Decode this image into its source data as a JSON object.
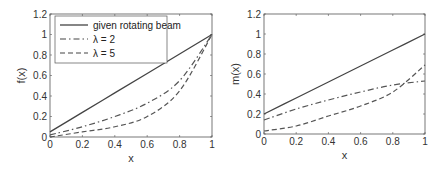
{
  "chart_data": [
    {
      "type": "line",
      "title": "",
      "xlabel": "x",
      "ylabel": "f(x)",
      "xlim": [
        0,
        1
      ],
      "ylim": [
        0,
        1.2
      ],
      "xticks": [
        "0",
        "0.2",
        "0.4",
        "0.6",
        "0.8",
        "1"
      ],
      "yticks": [
        "0",
        "0.2",
        "0.4",
        "0.6",
        "0.8",
        "1",
        "1.2"
      ],
      "grid": false,
      "legend_position": "upper left",
      "x": [
        0,
        0.2,
        0.4,
        0.6,
        0.8,
        1.0
      ],
      "series": [
        {
          "name": "given rotating beam",
          "style": "solid",
          "values": [
            0.05,
            0.24,
            0.43,
            0.62,
            0.81,
            1.0
          ]
        },
        {
          "name": "λ = 2",
          "style": "dash-dot",
          "values": [
            0.02,
            0.1,
            0.2,
            0.33,
            0.55,
            1.0
          ]
        },
        {
          "name": "λ = 5",
          "style": "dashed",
          "values": [
            0.0,
            0.05,
            0.1,
            0.2,
            0.45,
            1.0
          ]
        }
      ]
    },
    {
      "type": "line",
      "title": "",
      "xlabel": "x",
      "ylabel": "m(x)",
      "xlim": [
        0,
        1
      ],
      "ylim": [
        0,
        1.2
      ],
      "xticks": [
        "0",
        "0.2",
        "0.4",
        "0.6",
        "0.8",
        "1"
      ],
      "yticks": [
        "0",
        "0.2",
        "0.4",
        "0.6",
        "0.8",
        "1",
        "1.2"
      ],
      "grid": false,
      "x": [
        0,
        0.2,
        0.4,
        0.6,
        0.8,
        1.0
      ],
      "series": [
        {
          "name": "given rotating beam",
          "style": "solid",
          "values": [
            0.2,
            0.36,
            0.52,
            0.68,
            0.84,
            1.0
          ]
        },
        {
          "name": "λ = 2",
          "style": "dash-dot",
          "values": [
            0.14,
            0.25,
            0.34,
            0.42,
            0.49,
            0.53
          ]
        },
        {
          "name": "λ = 5",
          "style": "dashed",
          "values": [
            0.03,
            0.08,
            0.18,
            0.28,
            0.42,
            0.69
          ]
        }
      ]
    }
  ]
}
